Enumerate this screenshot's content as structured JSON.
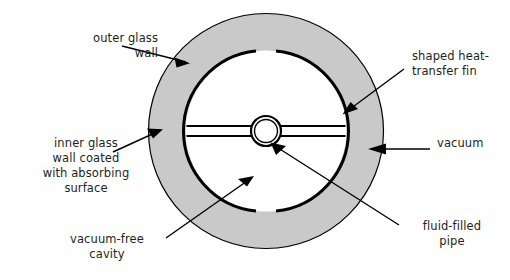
{
  "figure": {
    "kind": "cross-section-diagram"
  },
  "colors": {
    "outline": "#000000",
    "vacuum_fill": "#c9c9c9",
    "cavity_fill": "#ffffff",
    "page_background": "#ffffff",
    "text": "#231f20",
    "leader_line": "#000000"
  },
  "labels": {
    "outer_glass_wall": {
      "line1": "outer glass",
      "line2": "wall",
      "icon": "leader-arrow-icon"
    },
    "inner_glass_wall": {
      "line1": "inner glass",
      "line2": "wall coated",
      "line3": "with absorbing",
      "line4": "surface",
      "icon": "leader-arrow-icon"
    },
    "shaped_heat_transfer_fin": {
      "line1": "shaped heat-",
      "line2": "transfer fin",
      "icon": "leader-arrow-icon"
    },
    "vacuum": {
      "line1": "vacuum",
      "icon": "leader-arrow-icon"
    },
    "fluid_filled_pipe": {
      "line1": "fluid-filled",
      "line2": "pipe",
      "icon": "leader-line-icon"
    },
    "vacuum_free_cavity": {
      "line1": "vacuum-free",
      "line2": "cavity",
      "icon": "leader-line-icon"
    }
  },
  "geometry": {
    "center_x": 266,
    "center_y": 131,
    "outer_wall_radius": 118,
    "inner_wall_radius": 81,
    "pipe_radius": 14,
    "fin_half_height": 5,
    "inner_wall_gap_top_degrees": 14,
    "inner_wall_gap_bottom_degrees": 14
  }
}
